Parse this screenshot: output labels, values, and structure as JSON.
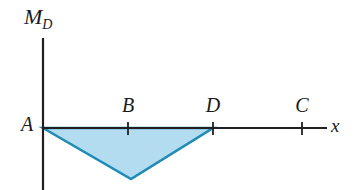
{
  "figure": {
    "title": "",
    "background_color": "#ffffff"
  },
  "axes": {
    "y_axis_label": "M",
    "y_axis_label_subscript": "D",
    "x_axis_label": "x",
    "origin_label": "A",
    "axis_color": "#231f20",
    "origin_px": {
      "x": 43,
      "y": 128
    },
    "y_axis_top_px": 38,
    "y_axis_bottom_px": 190,
    "x_axis_end_px": 327
  },
  "ticks": [
    {
      "label": "B",
      "x_px": 128
    },
    {
      "label": "D",
      "x_px": 213
    },
    {
      "label": "C",
      "x_px": 302
    }
  ],
  "chart_data": {
    "type": "area",
    "title": "",
    "xlabel": "x",
    "ylabel": "M_D",
    "grid": false,
    "legend": null,
    "categories": [
      "A",
      "B",
      "D",
      "C"
    ],
    "x": [
      0,
      1,
      2,
      3
    ],
    "x_pixels": [
      43,
      128,
      213,
      302
    ],
    "series": [
      {
        "name": "Bending moment M_D",
        "description": "Negative triangular bending-moment diagram from A to D with minimum near B",
        "points": [
          {
            "label": "A",
            "x": 0,
            "y": 0
          },
          {
            "label": "B",
            "x": 1,
            "y": -1
          },
          {
            "label": "D",
            "x": 2,
            "y": 0
          },
          {
            "label": "C",
            "x": 3,
            "y": 0
          }
        ],
        "values": [
          0,
          -1,
          0,
          0
        ],
        "fill_color": "#b3dcf0",
        "stroke_color": "#1f8cb5"
      }
    ],
    "polygon_pixels": [
      {
        "x": 43,
        "y": 128
      },
      {
        "x": 131,
        "y": 179
      },
      {
        "x": 213,
        "y": 128
      }
    ],
    "ylim": [
      -1.2,
      1.8
    ],
    "xlim": [
      0,
      3.35
    ]
  },
  "colors": {
    "shaded_area_fill": "#b3dcf0",
    "shaded_area_stroke": "#1f8cb5",
    "axis": "#231f20",
    "text": "#1a1a1a",
    "background": "#ffffff"
  }
}
